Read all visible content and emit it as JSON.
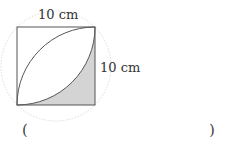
{
  "diagram": {
    "shape": "square with two quarter-circle arcs forming a lens; shaded region bottom-right",
    "top_label": "10 cm",
    "right_label": "10 cm",
    "square_side_cm": 10,
    "colors": {
      "stroke": "#555555",
      "shade": "#d4d4d4",
      "dotted_circle": "#d8d8d8"
    }
  },
  "answer": {
    "open_paren": "(",
    "close_paren": ")",
    "value": ""
  }
}
